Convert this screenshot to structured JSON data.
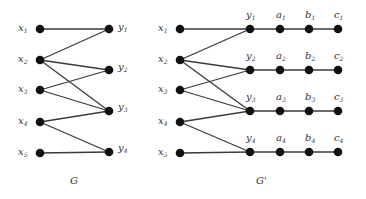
{
  "colors": {
    "node": "#111111",
    "edge": "#3a3a3a",
    "label": "#333333",
    "background": "#ffffff"
  },
  "graphs": [
    {
      "name": "G",
      "caption": "G",
      "nodes": [
        {
          "id": "x1",
          "base": "x",
          "sub": "1",
          "label_side": "left"
        },
        {
          "id": "x2",
          "base": "x",
          "sub": "2",
          "label_side": "left"
        },
        {
          "id": "x3",
          "base": "x",
          "sub": "3",
          "label_side": "left"
        },
        {
          "id": "x4",
          "base": "x",
          "sub": "4",
          "label_side": "left"
        },
        {
          "id": "x5",
          "base": "x",
          "sub": "5",
          "label_side": "left"
        },
        {
          "id": "y1",
          "base": "y",
          "sub": "1",
          "label_side": "right"
        },
        {
          "id": "y2",
          "base": "y",
          "sub": "2",
          "label_side": "right"
        },
        {
          "id": "y3",
          "base": "y",
          "sub": "3",
          "label_side": "right"
        },
        {
          "id": "y4",
          "base": "y",
          "sub": "4",
          "label_side": "right"
        }
      ],
      "edges": [
        [
          "x1",
          "y1"
        ],
        [
          "x2",
          "y1"
        ],
        [
          "x2",
          "y2"
        ],
        [
          "x2",
          "y3"
        ],
        [
          "x3",
          "y2"
        ],
        [
          "x3",
          "y3"
        ],
        [
          "x4",
          "y3"
        ],
        [
          "x4",
          "y4"
        ],
        [
          "x5",
          "y4"
        ]
      ]
    },
    {
      "name": "G-prime",
      "caption": "G'",
      "nodes": [
        {
          "id": "x1",
          "base": "x",
          "sub": "1",
          "label_side": "left"
        },
        {
          "id": "x2",
          "base": "x",
          "sub": "2",
          "label_side": "left"
        },
        {
          "id": "x3",
          "base": "x",
          "sub": "3",
          "label_side": "left"
        },
        {
          "id": "x4",
          "base": "x",
          "sub": "4",
          "label_side": "left"
        },
        {
          "id": "x5",
          "base": "x",
          "sub": "5",
          "label_side": "left"
        },
        {
          "id": "y1",
          "base": "y",
          "sub": "1",
          "label_side": "top"
        },
        {
          "id": "y2",
          "base": "y",
          "sub": "2",
          "label_side": "top"
        },
        {
          "id": "y3",
          "base": "y",
          "sub": "3",
          "label_side": "top"
        },
        {
          "id": "y4",
          "base": "y",
          "sub": "4",
          "label_side": "top"
        },
        {
          "id": "a1",
          "base": "a",
          "sub": "1",
          "label_side": "top"
        },
        {
          "id": "a2",
          "base": "a",
          "sub": "2",
          "label_side": "top"
        },
        {
          "id": "a3",
          "base": "a",
          "sub": "3",
          "label_side": "top"
        },
        {
          "id": "a4",
          "base": "a",
          "sub": "4",
          "label_side": "top"
        },
        {
          "id": "b1",
          "base": "b",
          "sub": "1",
          "label_side": "top"
        },
        {
          "id": "b2",
          "base": "b",
          "sub": "2",
          "label_side": "top"
        },
        {
          "id": "b3",
          "base": "b",
          "sub": "3",
          "label_side": "top"
        },
        {
          "id": "b4",
          "base": "b",
          "sub": "4",
          "label_side": "top"
        },
        {
          "id": "c1",
          "base": "c",
          "sub": "1",
          "label_side": "top"
        },
        {
          "id": "c2",
          "base": "c",
          "sub": "2",
          "label_side": "top"
        },
        {
          "id": "c3",
          "base": "c",
          "sub": "3",
          "label_side": "top"
        },
        {
          "id": "c4",
          "base": "c",
          "sub": "4",
          "label_side": "top"
        }
      ],
      "edges": [
        [
          "x1",
          "y1"
        ],
        [
          "x2",
          "y1"
        ],
        [
          "x2",
          "y2"
        ],
        [
          "x2",
          "y3"
        ],
        [
          "x3",
          "y2"
        ],
        [
          "x3",
          "y3"
        ],
        [
          "x4",
          "y3"
        ],
        [
          "x4",
          "y4"
        ],
        [
          "x5",
          "y4"
        ],
        [
          "y1",
          "a1"
        ],
        [
          "a1",
          "b1"
        ],
        [
          "b1",
          "c1"
        ],
        [
          "y2",
          "a2"
        ],
        [
          "a2",
          "b2"
        ],
        [
          "b2",
          "c2"
        ],
        [
          "y3",
          "a3"
        ],
        [
          "a3",
          "b3"
        ],
        [
          "b3",
          "c3"
        ],
        [
          "y4",
          "a4"
        ],
        [
          "a4",
          "b4"
        ],
        [
          "b4",
          "c4"
        ]
      ]
    }
  ],
  "labels": {
    "G": {
      "x1": "x",
      "x2": "x",
      "x3": "x",
      "x4": "x",
      "x5": "x",
      "y1": "y",
      "y2": "y",
      "y3": "y",
      "y4": "y",
      "s1": "1",
      "s2": "2",
      "s3": "3",
      "s4": "4",
      "s5": "5",
      "caption": "G"
    },
    "Gp": {
      "x": "x",
      "y": "y",
      "a": "a",
      "b": "b",
      "c": "c",
      "s1": "1",
      "s2": "2",
      "s3": "3",
      "s4": "4",
      "s5": "5",
      "caption": "G'"
    }
  }
}
